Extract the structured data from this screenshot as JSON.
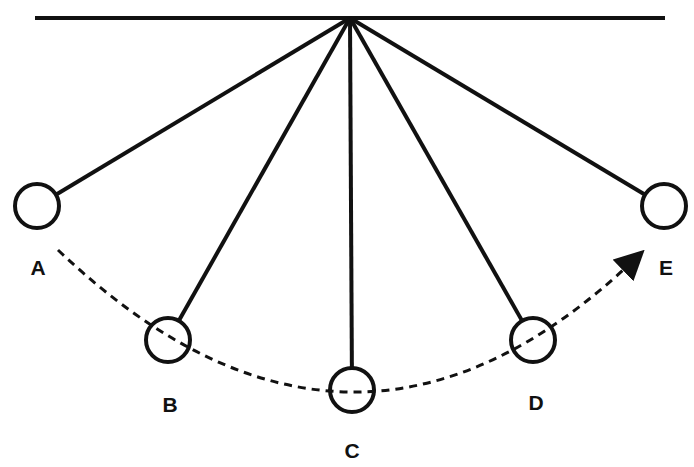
{
  "diagram": {
    "type": "pendulum-swing",
    "pivot": {
      "x": 350,
      "y": 18
    },
    "ceiling": {
      "x1": 35,
      "x2": 665,
      "y": 18
    },
    "positions": [
      {
        "label": "A",
        "cx": 37,
        "cy": 206,
        "lx": 38,
        "ly": 275
      },
      {
        "label": "B",
        "cx": 168,
        "cy": 340,
        "lx": 170,
        "ly": 412
      },
      {
        "label": "C",
        "cx": 352,
        "cy": 390,
        "lx": 352,
        "ly": 458
      },
      {
        "label": "D",
        "cx": 533,
        "cy": 340,
        "lx": 536,
        "ly": 410
      },
      {
        "label": "E",
        "cx": 664,
        "cy": 206,
        "lx": 666,
        "ly": 275
      }
    ],
    "bob_radius": 22,
    "arc_style": "dashed",
    "arrow_direction": "A to E",
    "colors": {
      "line": "#111111",
      "background": "#ffffff"
    }
  }
}
